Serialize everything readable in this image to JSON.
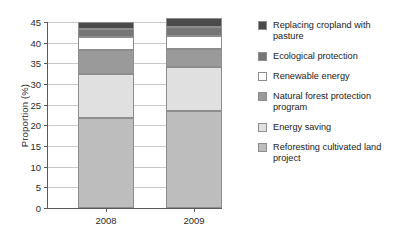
{
  "chart_data": {
    "type": "bar",
    "title": "",
    "subtitle": "",
    "xlabel": "",
    "ylabel": "Proportion (%)",
    "categories": [
      "2008",
      "2009"
    ],
    "ylim": [
      0,
      45
    ],
    "yticks": [
      0,
      5,
      10,
      15,
      20,
      25,
      30,
      35,
      40,
      45
    ],
    "ytick_labels": [
      "0",
      "5",
      "10",
      "15",
      "20",
      "25",
      "30",
      "35",
      "40",
      "45"
    ],
    "grid": true,
    "stacked": true,
    "legend_position": "right",
    "series": [
      {
        "name": "Replacing cropland with pasture",
        "color": "#4a4a4a",
        "values": [
          1.8,
          2.2
        ]
      },
      {
        "name": "Ecological protection",
        "color": "#767676",
        "values": [
          1.9,
          2.3
        ]
      },
      {
        "name": "Renewable energy",
        "color": "#ffffff",
        "values": [
          3.1,
          3.0
        ]
      },
      {
        "name": "Natural forest protection program",
        "color": "#9a9a9a",
        "values": [
          5.7,
          4.5
        ]
      },
      {
        "name": "Energy saving",
        "color": "#e0e0e0",
        "values": [
          10.8,
          10.5
        ]
      },
      {
        "name": "Reforesting cultivated land project",
        "color": "#bdbdbd",
        "values": [
          21.7,
          23.5
        ]
      }
    ],
    "totals": [
      45.0,
      46.0
    ]
  },
  "legend": {
    "items": [
      {
        "label": "Replacing cropland with pasture",
        "color": "#4a4a4a"
      },
      {
        "label": "Ecological protection",
        "color": "#767676"
      },
      {
        "label": "Renewable energy",
        "color": "#ffffff"
      },
      {
        "label": "Natural forest protection program",
        "color": "#9a9a9a"
      },
      {
        "label": "Energy saving",
        "color": "#e0e0e0"
      },
      {
        "label": "Reforesting cultivated land project",
        "color": "#bdbdbd"
      }
    ]
  }
}
